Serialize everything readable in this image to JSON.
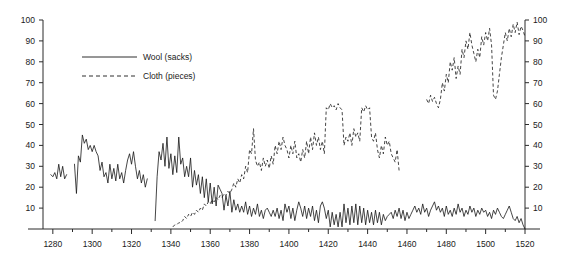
{
  "chart_data": {
    "type": "line",
    "title": "",
    "xlabel": "",
    "ylabel": "",
    "xlim": [
      1275,
      1520
    ],
    "ylim": [
      0,
      100
    ],
    "grid": false,
    "legend_position": "upper-left-inside",
    "x_ticks": [
      1280,
      1300,
      1320,
      1340,
      1360,
      1380,
      1400,
      1420,
      1440,
      1460,
      1480,
      1500,
      1520
    ],
    "x_tick_labels": [
      "1280",
      "1300",
      "1320",
      "1340",
      "1360",
      "1380",
      "1400",
      "1420",
      "1440",
      "1460",
      "1480",
      "1500",
      "1520"
    ],
    "x_minor_ticks": [
      1290,
      1310,
      1330,
      1350,
      1370,
      1390,
      1410,
      1430,
      1450,
      1470,
      1490,
      1510
    ],
    "y_ticks": [
      10,
      20,
      30,
      40,
      50,
      60,
      70,
      80,
      90,
      100
    ],
    "y_tick_labels": [
      "10",
      "20",
      "30",
      "40",
      "50",
      "60",
      "70",
      "80",
      "90",
      "100"
    ],
    "y_ticks_right": [
      10,
      20,
      30,
      40,
      50,
      60,
      70,
      80,
      90,
      100
    ],
    "y_tick_labels_right": [
      "10",
      "20",
      "30",
      "40",
      "50",
      "60",
      "70",
      "80",
      "90",
      "100"
    ],
    "series": [
      {
        "name": "Wool (sacks)",
        "style": "solid",
        "color": "#161616",
        "segments": [
          {
            "x": [
              1279,
              1280,
              1281,
              1282,
              1283,
              1284,
              1285,
              1286,
              1287
            ],
            "values": [
              26,
              25,
              27,
              24,
              31,
              25,
              30,
              24,
              26
            ]
          },
          {
            "x": [
              1291,
              1292,
              1293,
              1294,
              1295,
              1296,
              1297,
              1298,
              1299,
              1300,
              1301,
              1302,
              1303,
              1304,
              1305,
              1306,
              1307,
              1308,
              1309,
              1310,
              1311,
              1312,
              1313,
              1314,
              1315,
              1316,
              1317,
              1318,
              1319,
              1320,
              1321,
              1322,
              1323,
              1324,
              1325,
              1326,
              1327,
              1328
            ],
            "values": [
              31,
              17,
              35,
              32,
              45,
              41,
              43,
              38,
              40,
              37,
              40,
              37,
              35,
              28,
              32,
              25,
              27,
              22,
              31,
              24,
              29,
              23,
              31,
              24,
              27,
              22,
              28,
              33,
              36,
              31,
              37,
              30,
              24,
              28,
              22,
              26,
              20,
              24
            ]
          },
          {
            "x": [
              1332,
              1333,
              1334,
              1335,
              1336,
              1337,
              1338,
              1339,
              1340,
              1341,
              1342,
              1343,
              1344,
              1345,
              1346,
              1347,
              1348,
              1349,
              1350,
              1351,
              1352,
              1353,
              1354,
              1355,
              1356,
              1357,
              1358,
              1359,
              1360,
              1361,
              1362,
              1363,
              1364,
              1365,
              1366,
              1367,
              1368,
              1369,
              1370,
              1371,
              1372,
              1373,
              1374,
              1375,
              1376,
              1377,
              1378,
              1379,
              1380,
              1381,
              1382,
              1383,
              1384,
              1385,
              1386,
              1387,
              1388,
              1389,
              1390,
              1391,
              1392,
              1393,
              1394,
              1395,
              1396,
              1397,
              1398,
              1399,
              1400,
              1401,
              1402,
              1403,
              1404,
              1405,
              1406,
              1407,
              1408,
              1409,
              1410,
              1411,
              1412,
              1413,
              1414,
              1415,
              1416,
              1417,
              1418,
              1419,
              1420,
              1421,
              1422,
              1423,
              1424,
              1425,
              1426,
              1427,
              1428,
              1429,
              1430,
              1431,
              1432,
              1433,
              1434,
              1435,
              1436,
              1437,
              1438,
              1439,
              1440,
              1441,
              1442,
              1443,
              1444,
              1445,
              1446,
              1447,
              1448,
              1449,
              1450,
              1451,
              1452,
              1453,
              1454,
              1455,
              1456,
              1457,
              1458,
              1459,
              1460,
              1461,
              1462,
              1463,
              1464,
              1465,
              1466,
              1467,
              1468,
              1469,
              1470,
              1471,
              1472,
              1473,
              1474,
              1475,
              1476,
              1477,
              1478,
              1479,
              1480,
              1481,
              1482,
              1483,
              1484,
              1485,
              1486,
              1487,
              1488,
              1489,
              1490,
              1491,
              1492,
              1493,
              1494,
              1495,
              1496,
              1497,
              1498,
              1499,
              1500,
              1501,
              1502,
              1503,
              1504,
              1505,
              1506,
              1507,
              1508,
              1509,
              1510,
              1511,
              1512,
              1513,
              1514,
              1515,
              1516,
              1517,
              1518,
              1519,
              1520
            ],
            "values": [
              4,
              25,
              37,
              33,
              41,
              30,
              44,
              29,
              36,
              26,
              35,
              27,
              44,
              31,
              34,
              25,
              30,
              25,
              34,
              20,
              28,
              21,
              26,
              17,
              25,
              15,
              24,
              13,
              22,
              12,
              20,
              11,
              21,
              19,
              17,
              9,
              16,
              11,
              18,
              8,
              14,
              9,
              12,
              8,
              11,
              8,
              13,
              7,
              11,
              6,
              10,
              7,
              12,
              6,
              9,
              5,
              9,
              10,
              8,
              6,
              9,
              6,
              10,
              5,
              9,
              4,
              12,
              8,
              11,
              5,
              10,
              4,
              9,
              13,
              10,
              6,
              11,
              5,
              10,
              6,
              11,
              4,
              9,
              3,
              11,
              13,
              10,
              5,
              9,
              1,
              8,
              2,
              7,
              1,
              8,
              1,
              12,
              3,
              10,
              2,
              11,
              3,
              12,
              2,
              11,
              3,
              10,
              2,
              9,
              3,
              8,
              2,
              9,
              3,
              8,
              2,
              7,
              4,
              6,
              7,
              8,
              5,
              9,
              6,
              10,
              5,
              9,
              4,
              8,
              5,
              7,
              9,
              11,
              8,
              10,
              7,
              12,
              8,
              10,
              6,
              9,
              11,
              13,
              9,
              11,
              8,
              10,
              6,
              11,
              7,
              9,
              6,
              10,
              7,
              12,
              8,
              10,
              6,
              9,
              7,
              11,
              8,
              10,
              6,
              9,
              7,
              10,
              8,
              9,
              6,
              8,
              5,
              9,
              7,
              10,
              8,
              6,
              5,
              7,
              9,
              11,
              8,
              5,
              4,
              6,
              3,
              5,
              2,
              0
            ]
          }
        ]
      },
      {
        "name": "Cloth (pieces)",
        "style": "dashed",
        "color": "#161616",
        "segments": [
          {
            "x": [
              1341,
              1342,
              1343,
              1344,
              1345,
              1346,
              1347,
              1348,
              1349,
              1350,
              1351,
              1352,
              1353,
              1354,
              1355,
              1356,
              1357,
              1358,
              1359,
              1360,
              1361,
              1362,
              1363,
              1364,
              1365,
              1366,
              1367,
              1368,
              1369,
              1370,
              1371,
              1372,
              1373,
              1374,
              1375,
              1376,
              1377,
              1378,
              1379,
              1380,
              1381,
              1382,
              1383,
              1384,
              1385,
              1386,
              1387,
              1388,
              1389,
              1390,
              1391,
              1392,
              1393,
              1394,
              1395,
              1396,
              1397,
              1398,
              1399,
              1400,
              1401,
              1402,
              1403,
              1404,
              1405,
              1406,
              1407,
              1408,
              1409,
              1410,
              1411,
              1412,
              1413,
              1414,
              1415,
              1416,
              1417,
              1418,
              1419,
              1420,
              1421,
              1422,
              1423,
              1424,
              1425,
              1426,
              1427,
              1428,
              1429,
              1430,
              1431,
              1432,
              1433,
              1434,
              1435,
              1436,
              1437,
              1438,
              1439,
              1440,
              1441,
              1442,
              1443,
              1444,
              1445,
              1446,
              1447,
              1448,
              1449,
              1450,
              1451,
              1452,
              1453,
              1454,
              1455,
              1456
            ],
            "values": [
              1,
              2,
              2,
              3,
              3,
              4,
              6,
              5,
              7,
              6,
              8,
              7,
              9,
              8,
              10,
              9,
              12,
              11,
              13,
              12,
              14,
              13,
              15,
              14,
              16,
              15,
              17,
              16,
              18,
              17,
              19,
              22,
              20,
              24,
              22,
              26,
              24,
              30,
              27,
              38,
              36,
              48,
              33,
              30,
              32,
              28,
              34,
              30,
              33,
              29,
              35,
              31,
              40,
              36,
              42,
              38,
              44,
              40,
              38,
              34,
              40,
              36,
              42,
              34,
              36,
              32,
              38,
              34,
              42,
              36,
              44,
              38,
              46,
              40,
              44,
              38,
              42,
              36,
              58,
              57,
              60,
              58,
              59,
              57,
              60,
              58,
              57,
              40,
              44,
              42,
              46,
              40,
              48,
              44,
              46,
              42,
              58,
              56,
              59,
              57,
              58,
              44,
              42,
              46,
              38,
              34,
              40,
              36,
              44,
              40,
              42,
              36,
              34,
              32,
              38,
              28
            ]
          },
          {
            "x": [
              1470,
              1471,
              1472,
              1473,
              1474,
              1475,
              1476,
              1477,
              1478,
              1479,
              1480,
              1481,
              1482,
              1483,
              1484,
              1485,
              1486,
              1487,
              1488,
              1489,
              1490,
              1491,
              1492,
              1493,
              1494,
              1495,
              1496,
              1497,
              1498,
              1499,
              1500,
              1501,
              1502,
              1503,
              1504,
              1505,
              1506,
              1507,
              1508,
              1509,
              1510,
              1511,
              1512,
              1513,
              1514,
              1515,
              1516,
              1517,
              1518,
              1519,
              1520
            ],
            "values": [
              62,
              60,
              64,
              61,
              63,
              60,
              58,
              62,
              70,
              66,
              74,
              70,
              80,
              76,
              82,
              72,
              78,
              74,
              86,
              82,
              90,
              86,
              94,
              88,
              84,
              80,
              86,
              82,
              92,
              88,
              94,
              90,
              96,
              88,
              64,
              62,
              66,
              74,
              82,
              88,
              94,
              90,
              96,
              92,
              98,
              94,
              99,
              93,
              97,
              95,
              92
            ]
          }
        ]
      }
    ]
  },
  "legend": {
    "entries": [
      {
        "label": "Wool (sacks)",
        "style": "solid"
      },
      {
        "label": "Cloth (pieces)",
        "style": "dashed"
      }
    ]
  }
}
